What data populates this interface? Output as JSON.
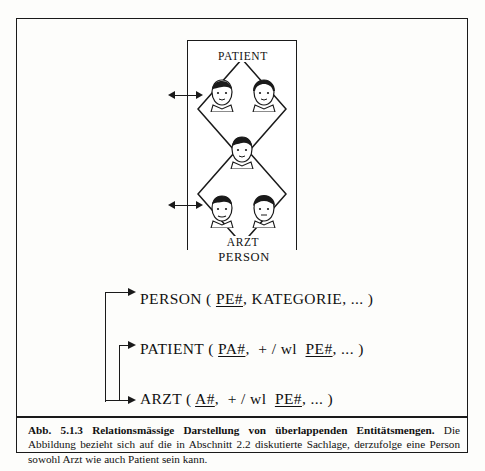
{
  "figure": {
    "outer_label": "PERSON",
    "sets": [
      {
        "name": "PATIENT"
      },
      {
        "name": "ARZT"
      }
    ],
    "faces": [
      {
        "id": "patient-face-1",
        "set": "PATIENT"
      },
      {
        "id": "patient-face-2",
        "set": "PATIENT"
      },
      {
        "id": "overlap-face",
        "set": "PATIENT-ARZT"
      },
      {
        "id": "arzt-face-1",
        "set": "ARZT"
      },
      {
        "id": "arzt-face-2",
        "set": "ARZT"
      }
    ]
  },
  "schema": {
    "person": {
      "name": "PERSON",
      "open": " ( ",
      "key": "PE#",
      "rest": ", KATEGORIE, ... )"
    },
    "patient": {
      "name": "PATIENT",
      "open": " ( ",
      "key": "PA#",
      "mid": ",  + / wl  ",
      "fkey": "PE#",
      "rest": ", ... )"
    },
    "arzt": {
      "name": "ARZT",
      "open": " ( ",
      "key": "A#",
      "mid": ",  + / wl  ",
      "fkey": "PE#",
      "rest": ", ... )"
    }
  },
  "caption": {
    "number": "Abb. 5.1.3",
    "title": "Relationsmässige Darstellung von überlappenden Entitätsmengen.",
    "text": "Die Abbildung bezieht sich auf die in Abschnitt 2.2 diskutierte Sachlage, derzufolge eine Person sowohl Arzt wie auch Patient sein kann."
  }
}
